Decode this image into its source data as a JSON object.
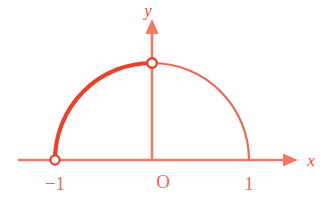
{
  "figure": {
    "title": "",
    "background_color": "#ffffff",
    "colors": {
      "axis": "#ef7a66",
      "arc_thin": "#ea6a56",
      "arc_bold": "#e8412c",
      "label": "#e8523c",
      "marker_fill": "#ffffff",
      "marker_stroke": "#e8412c"
    },
    "axes": {
      "x_axis_label": "x",
      "y_axis_label": "y",
      "origin_label": "O",
      "x_has_arrow": true,
      "y_has_arrow": true,
      "x_ticks": [
        {
          "label": "−1",
          "value": -1
        },
        {
          "label": "1",
          "value": 1
        }
      ],
      "y_ticks": []
    },
    "curve": {
      "description": "upper unit semicircle",
      "type": "semicircle",
      "center": [
        0,
        0
      ],
      "radius": 1,
      "domain": [
        -1,
        1
      ],
      "range": [
        0,
        1
      ],
      "segments": [
        {
          "name": "left-half-bold",
          "from_x": -1,
          "to_x": 0,
          "emphasis": "bold"
        },
        {
          "name": "right-half-thin",
          "from_x": 0,
          "to_x": 1,
          "emphasis": "normal"
        }
      ]
    },
    "markers": [
      {
        "name": "open-point-left",
        "x": -1,
        "y": 0,
        "style": "open-circle"
      },
      {
        "name": "open-point-top",
        "x": 0,
        "y": 1,
        "style": "open-circle"
      }
    ]
  }
}
